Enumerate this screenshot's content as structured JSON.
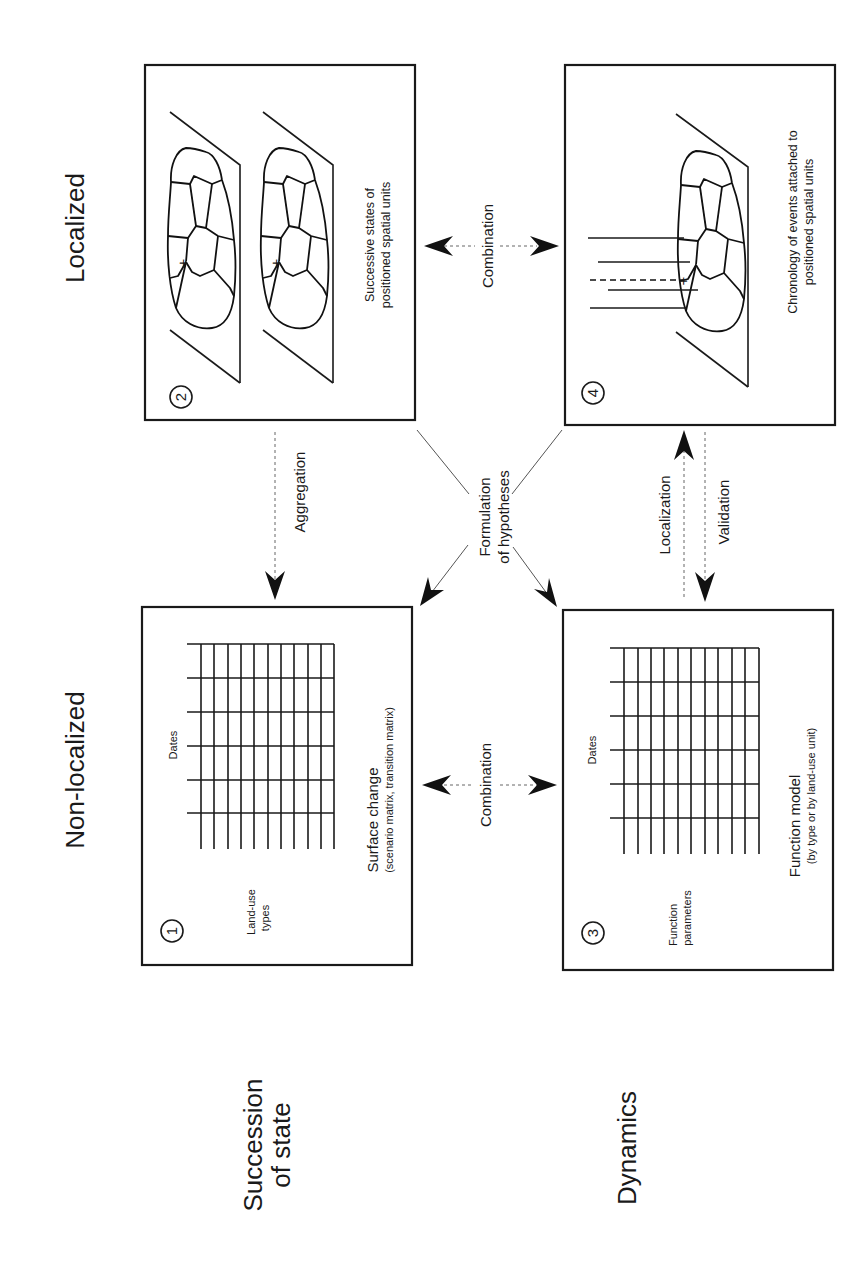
{
  "axis_labels": {
    "localized": "Localized",
    "non_localized": "Non-localized",
    "succession_line1": "Succession",
    "succession_line2": "of state",
    "dynamics": "Dynamics"
  },
  "boxes": [
    {
      "number": "1",
      "row_label_1": "Land-use",
      "row_label_2": "types",
      "col_label": "Dates",
      "caption": "Surface change",
      "subcaption": "(scenario matrix, transition matrix)"
    },
    {
      "number": "2",
      "caption_line1": "Successive states of",
      "caption_line2": "positioned spatial units"
    },
    {
      "number": "3",
      "row_label_1": "Function",
      "row_label_2": "parameters",
      "col_label": "Dates",
      "caption": "Function model",
      "subcaption": "(by type or by land-use unit)"
    },
    {
      "number": "4",
      "caption_line1": "Chronology of events attached to",
      "caption_line2": "positioned spatial units"
    }
  ],
  "arrows": {
    "combination_top": "Combination",
    "combination_bottom": "Combination",
    "aggregation": "Aggregation",
    "localization": "Localization",
    "validation": "Validation",
    "hypotheses_line1": "Formulation",
    "hypotheses_line2": "of hypotheses"
  }
}
